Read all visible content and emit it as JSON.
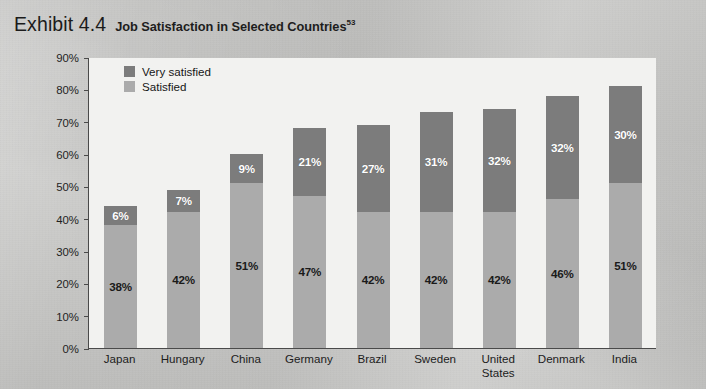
{
  "header": {
    "exhibit_number": "Exhibit 4.4",
    "title": "Job Satisfaction in Selected Countries",
    "footnote_marker": "53"
  },
  "legend": {
    "position": "top-left-inside",
    "items": [
      {
        "label": "Very satisfied",
        "color": "#7c7c7c",
        "swatch": "very"
      },
      {
        "label": "Satisfied",
        "color": "#ababab",
        "swatch": "sat"
      }
    ]
  },
  "axis": {
    "y_ticks": [
      "90%",
      "80%",
      "70%",
      "60%",
      "50%",
      "40%",
      "30%",
      "20%",
      "10%",
      "0%"
    ],
    "y_min": 0,
    "y_max": 90,
    "y_step": 10
  },
  "chart_data": {
    "type": "bar",
    "subtype": "stacked",
    "title": "Job Satisfaction in Selected Countries",
    "xlabel": "",
    "ylabel": "",
    "ylim": [
      0,
      90
    ],
    "ytick_values": [
      0,
      10,
      20,
      30,
      40,
      50,
      60,
      70,
      80,
      90
    ],
    "grid": false,
    "legend_position": "top-left-inside",
    "categories": [
      "Japan",
      "Hungary",
      "China",
      "Germany",
      "Brazil",
      "Sweden",
      "United States",
      "Denmark",
      "India"
    ],
    "series": [
      {
        "name": "Satisfied",
        "color": "#ababab",
        "values": [
          38,
          42,
          51,
          47,
          42,
          42,
          42,
          46,
          51
        ]
      },
      {
        "name": "Very satisfied",
        "color": "#7c7c7c",
        "values": [
          6,
          7,
          9,
          21,
          27,
          31,
          32,
          32,
          30
        ]
      }
    ],
    "totals": [
      44,
      49,
      60,
      68,
      69,
      73,
      74,
      78,
      81
    ],
    "data_labels": {
      "Satisfied": [
        "38%",
        "42%",
        "51%",
        "47%",
        "42%",
        "42%",
        "42%",
        "46%",
        "51%"
      ],
      "Very satisfied": [
        "6%",
        "7%",
        "9%",
        "21%",
        "27%",
        "31%",
        "32%",
        "32%",
        "30%"
      ]
    },
    "bars": [
      {
        "category": "Japan",
        "satisfied": 38,
        "very_satisfied": 6,
        "total": 44,
        "satisfied_label": "38%",
        "very_satisfied_label": "6%"
      },
      {
        "category": "Hungary",
        "satisfied": 42,
        "very_satisfied": 7,
        "total": 49,
        "satisfied_label": "42%",
        "very_satisfied_label": "7%"
      },
      {
        "category": "China",
        "satisfied": 51,
        "very_satisfied": 9,
        "total": 60,
        "satisfied_label": "51%",
        "very_satisfied_label": "9%"
      },
      {
        "category": "Germany",
        "satisfied": 47,
        "very_satisfied": 21,
        "total": 68,
        "satisfied_label": "47%",
        "very_satisfied_label": "21%"
      },
      {
        "category": "Brazil",
        "satisfied": 42,
        "very_satisfied": 27,
        "total": 69,
        "satisfied_label": "42%",
        "very_satisfied_label": "27%"
      },
      {
        "category": "Sweden",
        "satisfied": 42,
        "very_satisfied": 31,
        "total": 73,
        "satisfied_label": "42%",
        "very_satisfied_label": "31%"
      },
      {
        "category": "United States",
        "satisfied": 42,
        "very_satisfied": 32,
        "total": 74,
        "satisfied_label": "42%",
        "very_satisfied_label": "32%"
      },
      {
        "category": "Denmark",
        "satisfied": 46,
        "very_satisfied": 32,
        "total": 78,
        "satisfied_label": "46%",
        "very_satisfied_label": "32%"
      },
      {
        "category": "India",
        "satisfied": 51,
        "very_satisfied": 30,
        "total": 81,
        "satisfied_label": "51%",
        "very_satisfied_label": "30%"
      }
    ]
  },
  "colors": {
    "very_satisfied": "#7c7c7c",
    "satisfied": "#ababab",
    "plot_background": "#f2f2f0",
    "axis": "#4a4a4a",
    "page_background": "#c7c7c5"
  }
}
